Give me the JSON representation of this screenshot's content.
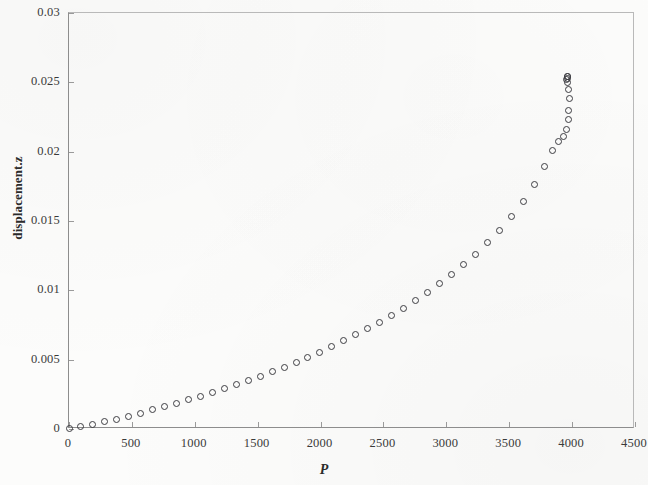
{
  "chart_data": {
    "type": "scatter",
    "title": "",
    "xlabel": "P",
    "ylabel": "displacement.z",
    "xlim": [
      0,
      4500
    ],
    "ylim": [
      0,
      0.03
    ],
    "grid": false,
    "legend": null,
    "marker": "open-circle",
    "x_ticks": [
      0,
      500,
      1000,
      1500,
      2000,
      2500,
      3000,
      3500,
      4000,
      4500
    ],
    "x_tick_labels": [
      "0",
      "500",
      "1000",
      "1500",
      "2000",
      "2500",
      "3000",
      "3500",
      "4000",
      "4500"
    ],
    "y_ticks": [
      0,
      0.005,
      0.01,
      0.015,
      0.02,
      0.025,
      0.03
    ],
    "y_tick_labels": [
      "0",
      "0.005",
      "0.01",
      "0.015",
      "0.02",
      "0.025",
      "0.03"
    ],
    "x": [
      0,
      95,
      190,
      285,
      380,
      475,
      570,
      665,
      760,
      855,
      950,
      1045,
      1140,
      1235,
      1330,
      1425,
      1520,
      1615,
      1710,
      1805,
      1900,
      1995,
      2090,
      2185,
      2280,
      2375,
      2470,
      2565,
      2660,
      2755,
      2850,
      2945,
      3040,
      3135,
      3230,
      3325,
      3420,
      3515,
      3610,
      3700,
      3780,
      3845,
      3895,
      3930,
      3955,
      3968,
      3975,
      3978,
      3972,
      3962,
      3958,
      3960,
      3962,
      3963
    ],
    "y": [
      5e-05,
      0.00018,
      0.00034,
      0.00052,
      0.00072,
      0.00093,
      0.00115,
      0.00138,
      0.00162,
      0.00186,
      0.00211,
      0.00237,
      0.00264,
      0.00292,
      0.0032,
      0.0035,
      0.00381,
      0.00413,
      0.00446,
      0.00481,
      0.00517,
      0.00555,
      0.00594,
      0.00635,
      0.00678,
      0.00723,
      0.0077,
      0.0082,
      0.00872,
      0.00928,
      0.00986,
      0.01048,
      0.01114,
      0.01185,
      0.01261,
      0.01343,
      0.01432,
      0.0153,
      0.0164,
      0.0176,
      0.01895,
      0.0201,
      0.0207,
      0.0211,
      0.0216,
      0.0223,
      0.023,
      0.0238,
      0.0245,
      0.025,
      0.0252,
      0.0253,
      0.0254,
      0.02545
    ],
    "series_name": "displacement.z vs P",
    "n_points": 54
  }
}
